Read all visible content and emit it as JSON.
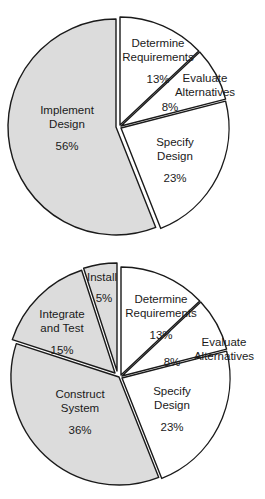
{
  "chart_data": [
    {
      "type": "pie",
      "title": "",
      "center": [
        118,
        127
      ],
      "radius": 108,
      "start_angle_deg": 0,
      "direction": "clockwise",
      "slices": [
        {
          "label": "Determine Requirements",
          "lines": [
            "Determine",
            "Requirements"
          ],
          "value": 13,
          "value_label": "13%",
          "shaded": false,
          "explode": [
            2,
            -2
          ],
          "label_pos": [
            158,
            47
          ]
        },
        {
          "label": "Evaluate Alternatives",
          "lines": [
            "Evaluate",
            "Alternatives"
          ],
          "value": 8,
          "value_label": "8%",
          "shaded": false,
          "explode": [
            3,
            -1
          ],
          "label_pos": [
            205,
            82
          ],
          "value_pos": [
            170,
            111
          ]
        },
        {
          "label": "Specify Design",
          "lines": [
            "Specify",
            "Design"
          ],
          "value": 23,
          "value_label": "23%",
          "shaded": false,
          "explode": [
            3,
            1
          ],
          "label_pos": [
            175,
            146
          ]
        },
        {
          "label": "Implement Design",
          "lines": [
            "Implement",
            "Design"
          ],
          "value": 56,
          "value_label": "56%",
          "shaded": true,
          "explode": [
            -2,
            0
          ],
          "label_pos": [
            67,
            114
          ]
        }
      ]
    },
    {
      "type": "pie",
      "title": "",
      "center": [
        119,
        377
      ],
      "radius": 108,
      "start_angle_deg": 0,
      "direction": "clockwise",
      "slices": [
        {
          "label": "Determine Requirements",
          "lines": [
            "Determine",
            "Requirements"
          ],
          "value": 13,
          "value_label": "13%",
          "shaded": false,
          "explode": [
            2,
            -2
          ],
          "label_pos": [
            161,
            303
          ]
        },
        {
          "label": "Evaluate Alternatives",
          "lines": [
            "Evaluate",
            "Alternatives"
          ],
          "value": 8,
          "value_label": "8%",
          "shaded": false,
          "explode": [
            3,
            -1
          ],
          "label_pos": [
            224,
            346
          ],
          "value_pos": [
            172,
            366
          ]
        },
        {
          "label": "Specify Design",
          "lines": [
            "Specify",
            "Design"
          ],
          "value": 23,
          "value_label": "23%",
          "shaded": false,
          "explode": [
            3,
            1
          ],
          "label_pos": [
            172,
            395
          ]
        },
        {
          "label": "Construct System",
          "lines": [
            "Construct",
            "System"
          ],
          "value": 36,
          "value_label": "36%",
          "shaded": true,
          "explode": [
            0,
            0
          ],
          "label_pos": [
            80,
            398
          ]
        },
        {
          "label": "Integrate and Test",
          "lines": [
            "Integrate",
            "and Test"
          ],
          "value": 15,
          "value_label": "15%",
          "shaded": true,
          "explode": [
            -4,
            -4
          ],
          "label_pos": [
            62,
            318
          ]
        },
        {
          "label": "Install",
          "lines": [
            "Install"
          ],
          "value": 5,
          "value_label": "5%",
          "shaded": true,
          "explode": [
            -2,
            -6
          ],
          "label_pos": [
            102,
            281
          ],
          "value_pos": [
            104,
            302
          ]
        }
      ]
    }
  ],
  "colors": {
    "shaded": "#dcdcdc",
    "unshaded": "#ffffff",
    "stroke": "#1a1a1a"
  }
}
